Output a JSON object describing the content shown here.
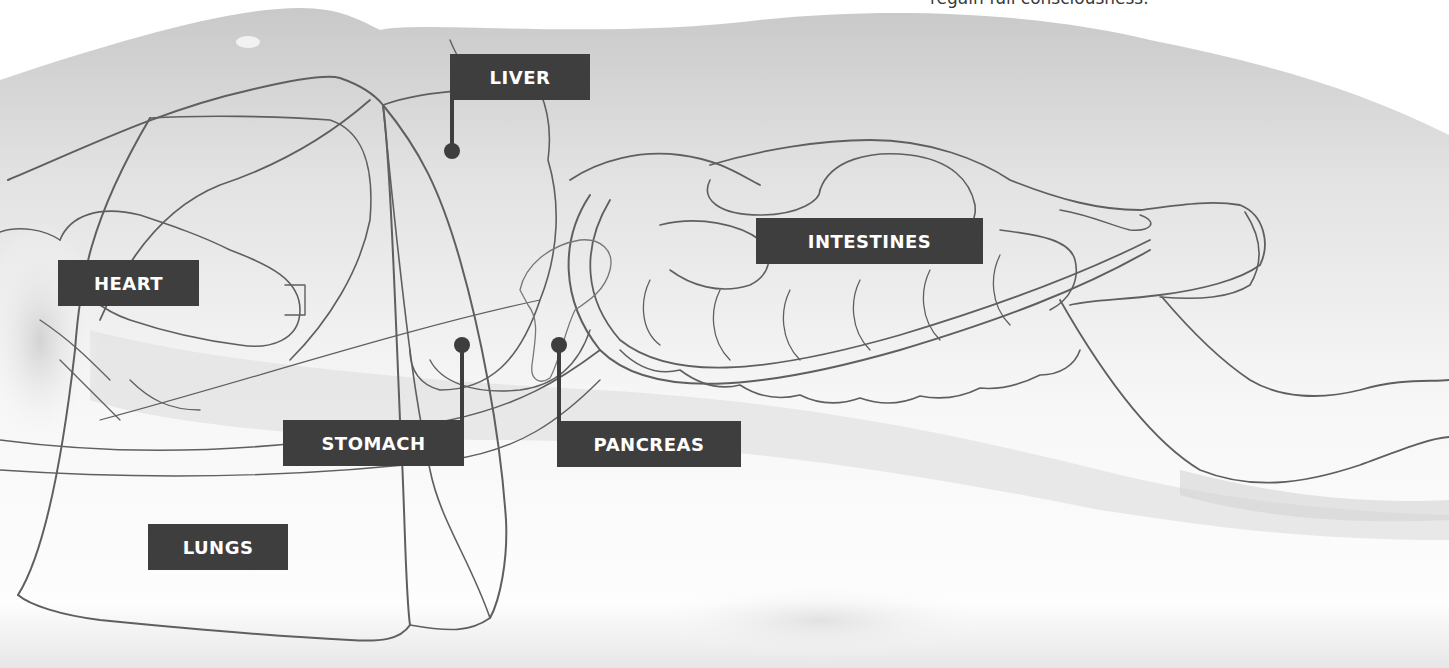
{
  "caption": "regain full consciousness.",
  "labels": {
    "liver": "LIVER",
    "heart": "HEART",
    "intestines": "INTESTINES",
    "stomach": "STOMACH",
    "pancreas": "PANCREAS",
    "lungs": "LUNGS"
  },
  "colors": {
    "label_background": "#3f3e3f",
    "label_text": "#ffffff",
    "outline": "#6a6a6a",
    "body_shading": "#d9d9d9"
  }
}
